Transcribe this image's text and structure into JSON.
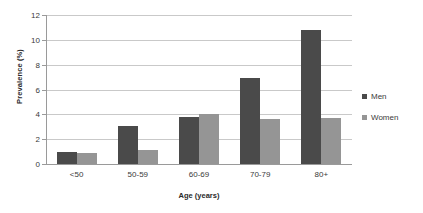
{
  "chart_data": {
    "type": "bar",
    "title": "",
    "xlabel": "Age (years)",
    "ylabel": "Prevalence (%)",
    "categories": [
      "<50",
      "50-59",
      "60-69",
      "70-79",
      "80+"
    ],
    "series": [
      {
        "name": "Men",
        "color": "#4a4a4a",
        "values": [
          1.0,
          3.05,
          3.8,
          6.9,
          10.8
        ]
      },
      {
        "name": "Women",
        "color": "#959595",
        "values": [
          0.85,
          1.15,
          4.0,
          3.65,
          3.7
        ]
      }
    ],
    "ylim": [
      0,
      12
    ],
    "yticks": [
      0,
      2,
      4,
      6,
      8,
      10,
      12
    ],
    "ytick_labels": [
      "0",
      "2",
      "4",
      "6",
      "8",
      "10",
      "12"
    ],
    "grid": true,
    "legend_position": "right"
  }
}
